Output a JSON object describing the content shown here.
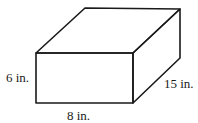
{
  "figure": {
    "type": "rectangular-prism",
    "dimensions": {
      "height": {
        "value": 6,
        "unit": "in.",
        "label": "6 in."
      },
      "width": {
        "value": 8,
        "unit": "in.",
        "label": "8 in."
      },
      "depth": {
        "value": 15,
        "unit": "in.",
        "label": "15 in."
      }
    },
    "colors": {
      "stroke": "#1a1a1a",
      "background": "#ffffff"
    }
  }
}
